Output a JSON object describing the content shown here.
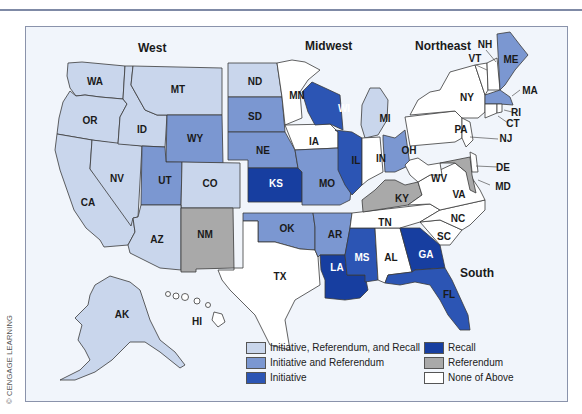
{
  "credit": "© CENGAGE LEARNING",
  "regions": {
    "west": "West",
    "midwest": "Midwest",
    "northeast": "Northeast",
    "south": "South"
  },
  "colors": {
    "irr": "#c9d6ec",
    "ir": "#7b97d1",
    "initiative": "#2c55b4",
    "recall": "#173ea0",
    "referendum": "#a9a9a9",
    "none": "#ffffff",
    "border": "#3a3a3a",
    "background": "#f1f5fb"
  },
  "legend": [
    {
      "key": "irr",
      "label": "Initiative, Referendum, and Recall"
    },
    {
      "key": "ir",
      "label": "Initiative and Referendum"
    },
    {
      "key": "initiative",
      "label": "Initiative"
    },
    {
      "key": "recall",
      "label": "Recall"
    },
    {
      "key": "referendum",
      "label": "Referendum"
    },
    {
      "key": "none",
      "label": "None of Above"
    }
  ],
  "states": {
    "WA": "irr",
    "OR": "irr",
    "CA": "irr",
    "NV": "irr",
    "ID": "irr",
    "MT": "irr",
    "AZ": "irr",
    "CO": "irr",
    "AK": "irr",
    "ND": "irr",
    "MI": "irr",
    "WY": "ir",
    "UT": "ir",
    "SD": "ir",
    "NE": "ir",
    "MO": "ir",
    "OK": "ir",
    "AR": "ir",
    "OH": "ir",
    "ME": "ir",
    "MA": "ir",
    "WI": "initiative",
    "IL": "initiative",
    "MS": "initiative",
    "FL": "initiative",
    "KS": "recall",
    "LA": "recall",
    "GA": "recall",
    "NM": "referendum",
    "KY": "referendum",
    "MD": "referendum",
    "HI": "none",
    "TX": "none",
    "MN": "none",
    "IA": "none",
    "IN": "none",
    "TN": "none",
    "AL": "none",
    "SC": "none",
    "NC": "none",
    "VA": "none",
    "WV": "none",
    "PA": "none",
    "NY": "none",
    "NJ": "none",
    "DE": "none",
    "CT": "none",
    "RI": "none",
    "VT": "none",
    "NH": "none"
  },
  "labels": {
    "WA": "WA",
    "OR": "OR",
    "CA": "CA",
    "NV": "NV",
    "ID": "ID",
    "MT": "MT",
    "WY": "WY",
    "UT": "UT",
    "CO": "CO",
    "AZ": "AZ",
    "NM": "NM",
    "AK": "AK",
    "HI": "HI",
    "ND": "ND",
    "SD": "SD",
    "NE": "NE",
    "KS": "KS",
    "MN": "MN",
    "IA": "IA",
    "MO": "MO",
    "WI": "WI",
    "IL": "IL",
    "MI": "MI",
    "IN": "IN",
    "OH": "OH",
    "OK": "OK",
    "TX": "TX",
    "AR": "AR",
    "LA": "LA",
    "MS": "MS",
    "AL": "AL",
    "TN": "TN",
    "KY": "KY",
    "GA": "GA",
    "FL": "FL",
    "SC": "SC",
    "NC": "NC",
    "VA": "VA",
    "WV": "WV",
    "MD": "MD",
    "DE": "DE",
    "PA": "PA",
    "NY": "NY",
    "NJ": "NJ",
    "CT": "CT",
    "RI": "RI",
    "MA": "MA",
    "VT": "VT",
    "NH": "NH",
    "ME": "ME"
  }
}
